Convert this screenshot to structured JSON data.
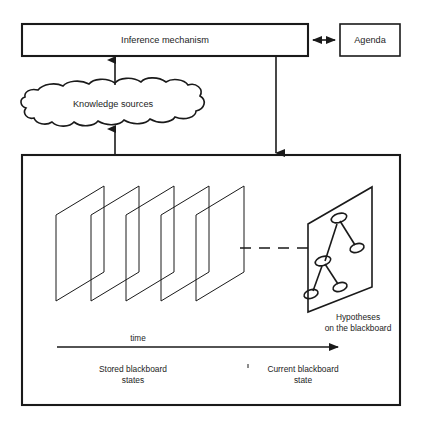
{
  "diagram": {
    "nodes": {
      "inference_mechanism": {
        "label": "Inference mechanism",
        "shape": "rectangle",
        "x": 22,
        "y": 24,
        "w": 286,
        "h": 32
      },
      "agenda": {
        "label": "Agenda",
        "shape": "rectangle",
        "x": 340,
        "y": 24,
        "w": 60,
        "h": 32
      },
      "knowledge_sources": {
        "label": "Knowledge sources",
        "shape": "cloud",
        "x": 22,
        "y": 82,
        "w": 183,
        "h": 45
      },
      "blackboard_container": {
        "label": "",
        "shape": "rectangle",
        "x": 22,
        "y": 155,
        "w": 378,
        "h": 250
      }
    },
    "captions": {
      "hypotheses_line1": "Hypotheses",
      "hypotheses_line2": "on the blackboard",
      "time_axis": "time",
      "stored_line1": "Stored blackboard",
      "stored_line2": "states",
      "current_line1": "Current blackboard",
      "current_line2": "state"
    },
    "connectors": [
      {
        "name": "inference-to-agenda",
        "type": "double-arrow",
        "orientation": "horizontal"
      },
      {
        "name": "knowledge-sources-to-inference",
        "type": "arrow-up",
        "orientation": "vertical"
      },
      {
        "name": "blackboard-to-knowledge-sources",
        "type": "arrow-up",
        "orientation": "vertical"
      },
      {
        "name": "inference-to-blackboard",
        "type": "arrow-down",
        "orientation": "vertical"
      },
      {
        "name": "states-to-current-link",
        "type": "dashed-line",
        "orientation": "horizontal"
      },
      {
        "name": "time-axis-arrow",
        "type": "arrow-right",
        "orientation": "horizontal"
      }
    ],
    "blackboard_states": {
      "count": 5,
      "description": "stored blackboard state planes"
    },
    "hypothesis_graph": {
      "node_count": 5,
      "edge_count": 4
    },
    "colors": {
      "stroke": "#1a1a1a",
      "background": "#ffffff",
      "text": "#1d1d1d"
    }
  }
}
